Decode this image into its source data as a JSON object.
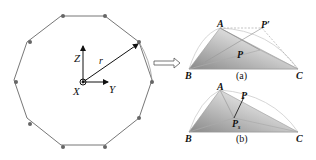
{
  "polygon": {
    "sides": 12,
    "center": [
      83,
      80
    ],
    "radius_label": "r",
    "axes": {
      "z": "Z",
      "y": "Y",
      "x": "X"
    },
    "colors": {
      "edge": "#777777",
      "vertex": "#666666"
    }
  },
  "arrow": {
    "type": "hollow-right-arrow"
  },
  "panel_a": {
    "caption": "(a)",
    "labels": {
      "A": "A",
      "B": "B",
      "C": "C",
      "P": "P",
      "Pprime": "P′"
    }
  },
  "panel_b": {
    "caption": "(b)",
    "labels": {
      "A": "A",
      "B": "B",
      "C": "C",
      "P": "P",
      "Ps": "P",
      "Ps_sub": "s"
    }
  }
}
